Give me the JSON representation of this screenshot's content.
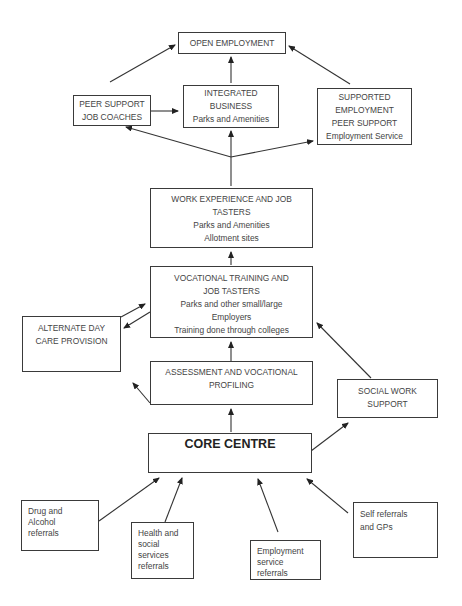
{
  "diagram": {
    "type": "flowchart",
    "nodes": {
      "open_employment": {
        "lines": [
          "OPEN EMPLOYMENT"
        ]
      },
      "peer_support": {
        "lines": [
          "PEER SUPPORT",
          "JOB COACHES"
        ]
      },
      "integrated_business": {
        "lines": [
          "INTEGRATED",
          "BUSINESS",
          "Parks and Amenities"
        ]
      },
      "supported_employment": {
        "lines": [
          "SUPPORTED",
          "EMPLOYMENT",
          "PEER SUPPORT",
          "Employment Service"
        ]
      },
      "work_experience": {
        "lines": [
          "WORK EXPERIENCE AND JOB",
          "TASTERS",
          "Parks and Amenities",
          "Allotment sites"
        ]
      },
      "vocational_training": {
        "lines": [
          "VOCATIONAL TRAINING AND",
          "JOB TASTERS",
          "Parks and other small/large",
          "Employers",
          "Training done through colleges"
        ]
      },
      "alternate_day_care": {
        "lines": [
          "ALTERNATE DAY",
          "CARE PROVISION"
        ]
      },
      "assessment": {
        "lines": [
          "ASSESSMENT AND VOCATIONAL",
          "PROFILING"
        ]
      },
      "social_work": {
        "lines": [
          "SOCIAL WORK",
          "SUPPORT"
        ]
      },
      "core_centre": {
        "lines": [
          "CORE CENTRE"
        ]
      },
      "drug_alcohol": {
        "lines": [
          "Drug and",
          "Alcohol",
          "referrals"
        ]
      },
      "health_social": {
        "lines": [
          "Health and",
          "social",
          "services",
          "referrals"
        ]
      },
      "employment_service": {
        "lines": [
          "Employment",
          "service",
          "referrals"
        ]
      },
      "self_referrals": {
        "lines": [
          "Self referrals",
          "and GPs"
        ]
      }
    },
    "edges": [
      {
        "from": "drug_alcohol",
        "to": "core_centre"
      },
      {
        "from": "health_social",
        "to": "core_centre"
      },
      {
        "from": "employment_service",
        "to": "core_centre"
      },
      {
        "from": "self_referrals",
        "to": "core_centre"
      },
      {
        "from": "core_centre",
        "to": "social_work"
      },
      {
        "from": "core_centre",
        "to": "assessment"
      },
      {
        "from": "assessment",
        "to": "alternate_day_care"
      },
      {
        "from": "assessment",
        "to": "vocational_training"
      },
      {
        "from": "social_work",
        "to": "vocational_training"
      },
      {
        "from": "alternate_day_care",
        "to": "vocational_training"
      },
      {
        "from": "vocational_training",
        "to": "alternate_day_care"
      },
      {
        "from": "vocational_training",
        "to": "work_experience"
      },
      {
        "from": "work_experience",
        "to": "peer_support"
      },
      {
        "from": "work_experience",
        "to": "integrated_business"
      },
      {
        "from": "work_experience",
        "to": "supported_employment"
      },
      {
        "from": "peer_support",
        "to": "integrated_business"
      },
      {
        "from": "peer_support",
        "to": "open_employment"
      },
      {
        "from": "integrated_business",
        "to": "open_employment"
      },
      {
        "from": "supported_employment",
        "to": "open_employment"
      }
    ],
    "colors": {
      "line": "#333333",
      "box_border": "#3a3a3a",
      "text": "#444444",
      "background": "#ffffff"
    }
  }
}
